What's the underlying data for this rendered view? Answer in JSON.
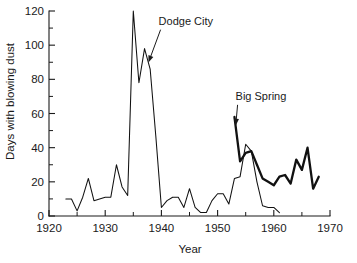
{
  "chart_data": {
    "type": "line",
    "title": "",
    "xlabel": "Year",
    "ylabel": "Days with blowing dust",
    "xlim": [
      1920,
      1970
    ],
    "ylim": [
      0,
      120
    ],
    "grid": false,
    "legend_position": "none",
    "x_ticks": [
      1920,
      1930,
      1940,
      1950,
      1960,
      1970
    ],
    "x_tick_labels": [
      "1920",
      "1930",
      "1940",
      "1950",
      "1960",
      "1970"
    ],
    "x_minor_step": 5,
    "y_ticks": [
      0,
      20,
      40,
      60,
      80,
      100,
      120
    ],
    "y_tick_labels": [
      "0",
      "20",
      "40",
      "60",
      "80",
      "100",
      "120"
    ],
    "y_minor_step": 10,
    "series": [
      {
        "name": "Dodge City",
        "style": "thin",
        "x": [
          1923,
          1924,
          1925,
          1926,
          1927,
          1928,
          1929,
          1930,
          1931,
          1932,
          1933,
          1934,
          1935,
          1936,
          1937,
          1938,
          1939,
          1940,
          1941,
          1942,
          1943,
          1944,
          1945,
          1946,
          1947,
          1948,
          1949,
          1950,
          1951,
          1952,
          1953,
          1954,
          1955,
          1956,
          1957,
          1958,
          1959,
          1960,
          1961
        ],
        "values": [
          10,
          10,
          3,
          11,
          22,
          9,
          10,
          11,
          11,
          30,
          17,
          12,
          120,
          78,
          98,
          86,
          47,
          5,
          9,
          11,
          11,
          5,
          16,
          5,
          2,
          2,
          9,
          13,
          13,
          7,
          22,
          23,
          42,
          38,
          20,
          6,
          5,
          5,
          2
        ]
      },
      {
        "name": "Big Spring",
        "style": "thick",
        "x": [
          1953,
          1954,
          1955,
          1956,
          1957,
          1958,
          1959,
          1960,
          1961,
          1962,
          1963,
          1964,
          1965,
          1966,
          1967,
          1968
        ],
        "values": [
          58,
          32,
          37,
          38,
          30,
          22,
          20,
          18,
          23,
          24,
          19,
          33,
          27,
          40,
          16,
          23
        ]
      }
    ],
    "annotations": [
      {
        "label": "Dodge City",
        "label_x": 1939.5,
        "label_y": 112,
        "target_x": 1937.6,
        "target_y": 89
      },
      {
        "label": "Big Spring",
        "label_x": 1953.2,
        "label_y": 68,
        "target_x": 1953.2,
        "target_y": 52
      }
    ]
  }
}
